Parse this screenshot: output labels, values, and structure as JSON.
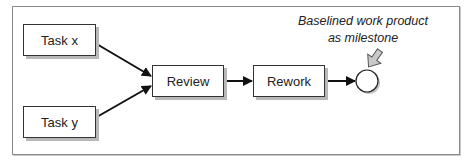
{
  "diagram": {
    "nodes": [
      {
        "id": "task_x",
        "label": "Task x",
        "type": "task"
      },
      {
        "id": "task_y",
        "label": "Task y",
        "type": "task"
      },
      {
        "id": "review",
        "label": "Review",
        "type": "task"
      },
      {
        "id": "rework",
        "label": "Rework",
        "type": "task"
      },
      {
        "id": "milestone",
        "label": "",
        "type": "milestone"
      }
    ],
    "edges": [
      {
        "from": "task_x",
        "to": "review"
      },
      {
        "from": "task_y",
        "to": "review"
      },
      {
        "from": "review",
        "to": "rework"
      },
      {
        "from": "rework",
        "to": "milestone"
      }
    ],
    "annotation": {
      "line1": "Baselined work product",
      "line2": "as milestone",
      "target": "milestone"
    },
    "colors": {
      "stroke": "#222222",
      "shadow": "#b8b8b8",
      "callout_arrow": "#bdbdbd",
      "frame": "#8a8a8a"
    }
  }
}
